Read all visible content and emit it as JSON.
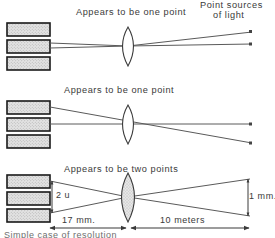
{
  "figure": {
    "title_hidden": "Optical resolution of two point sources by the eye",
    "panels": [
      {
        "id": "panel-1",
        "caption": "Appears to be one point",
        "receptor_count": 3,
        "lens_shaded": false,
        "description": "Two rays from two distant point sources converge onto a single receptor"
      },
      {
        "id": "panel-2",
        "caption": "Appears to be one point",
        "receptor_count": 3,
        "lens_shaded": false,
        "description": "Two rays land on adjacent receptors but still read as one point"
      },
      {
        "id": "panel-3",
        "caption": "Appears to be two points",
        "receptor_count": 3,
        "lens_shaded": true,
        "description": "Rays cross at the lens and separate onto two distinct receptors"
      }
    ],
    "labels": {
      "point_sources_line1": "Point sources",
      "point_sources_line2": "of light",
      "receptor_separation": "2 u",
      "object_separation": "1 mm.",
      "image_distance": "17 mm.",
      "object_distance": "10 meters"
    },
    "cut_off_caption": "Simple case of resolution",
    "colors": {
      "ink": "#3a3a3a",
      "ray": "#5a5a5a",
      "receptor_fill": "#d8d8d8",
      "receptor_border": "#1a1a1a",
      "lens_fill": "#d9d9d9",
      "background": "#ffffff"
    }
  }
}
